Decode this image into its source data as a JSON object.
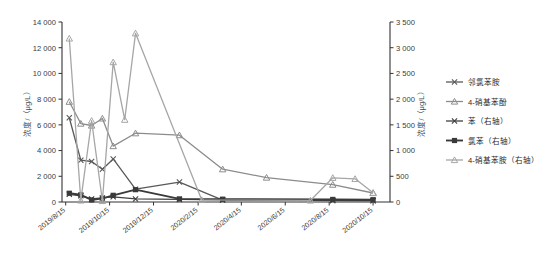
{
  "chart_data": {
    "type": "line",
    "title": "",
    "xlabel": "",
    "ylabel": "浓度/（μg/L）",
    "ylabel_right": "浓度/（μg/L）",
    "x": [
      "2019/8/15",
      "2019/10/15",
      "2019/12/15",
      "2020/2/15",
      "2020/4/15",
      "2020/6/15",
      "2020/8/15",
      "2020/10/15"
    ],
    "xtick_labels": [
      "2019/8/15",
      "2019/10/15",
      "2019/12/15",
      "2020/2/15",
      "2020/4/15",
      "2020/6/15",
      "2020/8/15",
      "2020/10/15"
    ],
    "ylim": [
      0,
      14000
    ],
    "ytick_labels": [
      "0",
      "2 000",
      "4 000",
      "6 000",
      "8 000",
      "10 000",
      "12 000",
      "14 000"
    ],
    "ytick_values": [
      0,
      2000,
      4000,
      6000,
      8000,
      10000,
      12000,
      14000
    ],
    "ylim_right": [
      0,
      3500
    ],
    "ytick_labels_right": [
      "0",
      "500",
      "1 000",
      "1 500",
      "2 000",
      "2 500",
      "3 000",
      "3 500"
    ],
    "ytick_values_right": [
      0,
      500,
      1000,
      1500,
      2000,
      2500,
      3000,
      3500
    ],
    "grid": false,
    "legend_position": "right",
    "series": [
      {
        "name": "邻氯苯胺",
        "axis": "left",
        "color": "#595959",
        "marker": "x",
        "points": [
          {
            "x": "2019/8/20",
            "y": 6550
          },
          {
            "x": "2019/9/5",
            "y": 3250
          },
          {
            "x": "2019/9/20",
            "y": 3150
          },
          {
            "x": "2019/10/5",
            "y": 2550
          },
          {
            "x": "2019/10/20",
            "y": 3350
          },
          {
            "x": "2019/11/20",
            "y": 1000
          },
          {
            "x": "2020/1/20",
            "y": 1550
          },
          {
            "x": "2020/3/20",
            "y": 150
          },
          {
            "x": "2020/8/20",
            "y": 110
          },
          {
            "x": "2020/10/15",
            "y": 110
          }
        ]
      },
      {
        "name": "4-硝基苯酚",
        "axis": "left",
        "color": "#8c8c8c",
        "marker": "triangle",
        "points": [
          {
            "x": "2019/8/20",
            "y": 7800
          },
          {
            "x": "2019/9/5",
            "y": 6100
          },
          {
            "x": "2019/9/20",
            "y": 5950
          },
          {
            "x": "2019/10/5",
            "y": 6500
          },
          {
            "x": "2019/10/20",
            "y": 4350
          },
          {
            "x": "2019/11/20",
            "y": 5350
          },
          {
            "x": "2020/1/20",
            "y": 5200
          },
          {
            "x": "2020/3/20",
            "y": 2550
          },
          {
            "x": "2020/5/20",
            "y": 1900
          },
          {
            "x": "2020/8/20",
            "y": 1350
          },
          {
            "x": "2020/10/15",
            "y": 700
          }
        ]
      },
      {
        "name": "苯（右轴）",
        "axis": "right",
        "color": "#404040",
        "marker": "x",
        "points": [
          {
            "x": "2019/8/20",
            "y": 150
          },
          {
            "x": "2019/9/5",
            "y": 120
          },
          {
            "x": "2019/9/20",
            "y": 60
          },
          {
            "x": "2019/10/5",
            "y": 80
          },
          {
            "x": "2019/10/20",
            "y": 100
          },
          {
            "x": "2019/11/20",
            "y": 60
          },
          {
            "x": "2020/1/20",
            "y": 50
          },
          {
            "x": "2020/3/20",
            "y": 40
          },
          {
            "x": "2020/8/20",
            "y": 30
          },
          {
            "x": "2020/10/15",
            "y": 25
          }
        ]
      },
      {
        "name": "氯苯（右轴）",
        "axis": "right",
        "color": "#3a3a3a",
        "marker": "square",
        "points": [
          {
            "x": "2019/8/20",
            "y": 170
          },
          {
            "x": "2019/9/5",
            "y": 140
          },
          {
            "x": "2019/9/20",
            "y": 40
          },
          {
            "x": "2019/10/5",
            "y": 70
          },
          {
            "x": "2019/10/20",
            "y": 130
          },
          {
            "x": "2019/11/20",
            "y": 240
          },
          {
            "x": "2020/1/20",
            "y": 60
          },
          {
            "x": "2020/3/20",
            "y": 55
          },
          {
            "x": "2020/8/20",
            "y": 50
          },
          {
            "x": "2020/10/15",
            "y": 45
          }
        ]
      },
      {
        "name": "4-硝基苯胺（右轴）",
        "axis": "right",
        "color": "#a6a6a6",
        "marker": "triangle",
        "points": [
          {
            "x": "2019/8/20",
            "y": 3180
          },
          {
            "x": "2019/9/5",
            "y": 30
          },
          {
            "x": "2019/9/20",
            "y": 1580
          },
          {
            "x": "2019/10/5",
            "y": 20
          },
          {
            "x": "2019/10/20",
            "y": 2720
          },
          {
            "x": "2019/11/5",
            "y": 1600
          },
          {
            "x": "2019/11/20",
            "y": 3280
          },
          {
            "x": "2020/2/20",
            "y": 40
          },
          {
            "x": "2020/7/20",
            "y": 30
          },
          {
            "x": "2020/8/20",
            "y": 470
          },
          {
            "x": "2020/9/20",
            "y": 450
          },
          {
            "x": "2020/10/15",
            "y": 180
          }
        ]
      }
    ]
  },
  "legend": {
    "items": [
      {
        "label": "邻氯苯胺",
        "color": "#595959",
        "marker": "x"
      },
      {
        "label": "4-硝基苯酚",
        "color": "#8c8c8c",
        "marker": "triangle"
      },
      {
        "label": "苯（右轴）",
        "color": "#404040",
        "marker": "x"
      },
      {
        "label": "氯苯（右轴）",
        "color": "#3a3a3a",
        "marker": "square"
      },
      {
        "label": "4-硝基苯胺（右轴）",
        "color": "#a6a6a6",
        "marker": "triangle"
      }
    ]
  },
  "axes": {
    "left_title": "浓度/（μg/L）",
    "right_title": "浓度/（μg/L）"
  }
}
